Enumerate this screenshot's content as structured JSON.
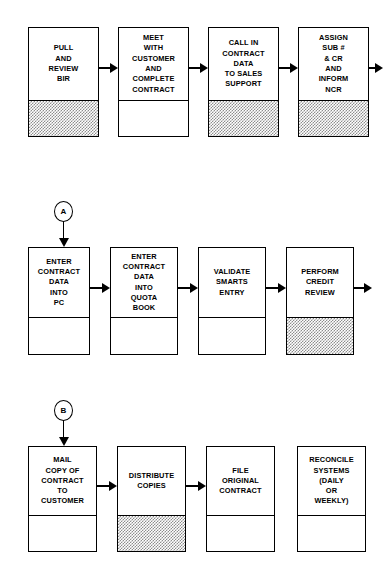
{
  "diagram": {
    "background_color": "#ffffff",
    "line_color": "#000000",
    "shade_color": "#8d8d8d"
  },
  "rows": [
    {
      "id": "row-1",
      "connector": null,
      "boxes": [
        {
          "id": "pull-and-review-bir",
          "label": "PULL\nAND\nREVIEW\nBIR",
          "shaded": true
        },
        {
          "id": "meet-with-customer-and-complete-contract",
          "label": "MEET\nWITH\nCUSTOMER\nAND\nCOMPLETE\nCONTRACT",
          "shaded": false
        },
        {
          "id": "call-in-contract-data-to-sales-support",
          "label": "CALL IN\nCONTRACT\nDATA\nTO SALES\nSUPPORT",
          "shaded": true
        },
        {
          "id": "assign-sub-and-cr-and-inform-ncr",
          "label": "ASSIGN\nSUB #\n& CR\nAND\nINFORM\nNCR",
          "shaded": true
        }
      ],
      "exit_arrow": true
    },
    {
      "id": "row-2",
      "connector": {
        "id": "connector-a",
        "label": "A"
      },
      "boxes": [
        {
          "id": "enter-contract-data-into-pc",
          "label": "ENTER\nCONTRACT\nDATA\nINTO\nPC",
          "shaded": false
        },
        {
          "id": "enter-contract-data-into-quota-book",
          "label": "ENTER\nCONTRACT\nDATA\nINTO\nQUOTA\nBOOK",
          "shaded": false
        },
        {
          "id": "validate-smarts-entry",
          "label": "VALIDATE\nSMARTS\nENTRY",
          "shaded": false
        },
        {
          "id": "perform-credit-review",
          "label": "PERFORM\nCREDIT\nREVIEW",
          "shaded": true
        }
      ],
      "exit_arrow": true
    },
    {
      "id": "row-3",
      "connector": {
        "id": "connector-b",
        "label": "B"
      },
      "boxes": [
        {
          "id": "mail-copy-of-contract-to-customer",
          "label": "MAIL\nCOPY OF\nCONTRACT\nTO\nCUSTOMER",
          "shaded": false
        },
        {
          "id": "distribute-copies",
          "label": "DISTRIBUTE\nCOPIES",
          "shaded": true
        },
        {
          "id": "file-original-contract",
          "label": "FILE\nORIGINAL\nCONTRACT",
          "shaded": false
        },
        {
          "id": "reconcile-systems-daily-or-weekly",
          "label": "RECONCILE\nSYSTEMS\n(DAILY\nOR\nWEEKLY)",
          "shaded": false
        }
      ],
      "exit_arrow": false
    }
  ]
}
